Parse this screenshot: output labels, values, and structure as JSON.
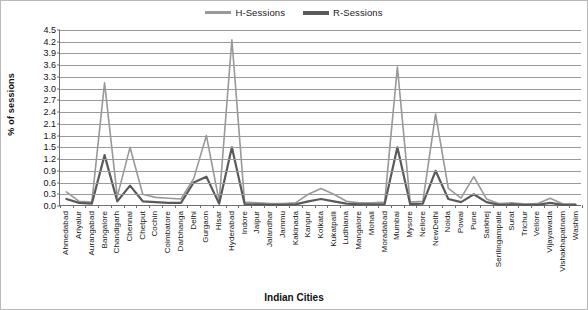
{
  "chart_data": {
    "type": "line",
    "title": "",
    "xlabel": "Indian Cities",
    "ylabel": "% of sessions",
    "ylim": [
      0.0,
      4.5
    ],
    "yticks": [
      "0.0",
      "0.3",
      "0.6",
      "0.9",
      "1.2",
      "1.5",
      "1.8",
      "2.1",
      "2.4",
      "2.7",
      "3.0",
      "3.3",
      "3.6",
      "3.9",
      "4.2",
      "4.5"
    ],
    "grid": true,
    "legend_position": "top-center",
    "categories": [
      "Ahmedabad",
      "Ariyalur",
      "Aurangabad",
      "Bangalore",
      "Chandigarh",
      "Chennai",
      "Chetput",
      "Cochin",
      "Coimbatore",
      "Darbhanga",
      "Delhi",
      "Gurgaon",
      "Hisar",
      "Hyderabad",
      "Indore",
      "Jaipur",
      "Jalandhar",
      "Jammu",
      "Kakinada",
      "Kanpur",
      "Kolkata",
      "Kukatpalli",
      "Ludhiana",
      "Mangalore",
      "Mohali",
      "Moradabad",
      "Mumbai",
      "Mysore",
      "Nellore",
      "NewDelhi",
      "Noida",
      "Powai",
      "Pune",
      "Sarkhej",
      "Serilingampalle",
      "Surat",
      "Trichur",
      "Vellore",
      "Vijayawada",
      "Vishakhapatnam",
      "Washim"
    ],
    "series": [
      {
        "name": "H-Sessions",
        "color": "#999999",
        "values": [
          0.36,
          0.12,
          0.1,
          3.15,
          0.24,
          1.5,
          0.3,
          0.22,
          0.2,
          0.18,
          0.7,
          1.8,
          0.12,
          4.25,
          0.1,
          0.08,
          0.06,
          0.06,
          0.08,
          0.3,
          0.45,
          0.3,
          0.12,
          0.08,
          0.08,
          0.1,
          3.55,
          0.1,
          0.12,
          2.35,
          0.45,
          0.2,
          0.75,
          0.18,
          0.06,
          0.08,
          0.05,
          0.06,
          0.2,
          0.05,
          0.05
        ]
      },
      {
        "name": "R-Sessions",
        "color": "#5a5a5a",
        "values": [
          0.18,
          0.08,
          0.06,
          1.3,
          0.12,
          0.52,
          0.12,
          0.1,
          0.08,
          0.08,
          0.6,
          0.75,
          0.06,
          1.5,
          0.05,
          0.04,
          0.03,
          0.03,
          0.04,
          0.12,
          0.18,
          0.12,
          0.06,
          0.04,
          0.04,
          0.05,
          1.5,
          0.05,
          0.06,
          0.9,
          0.18,
          0.1,
          0.3,
          0.1,
          0.03,
          0.04,
          0.03,
          0.03,
          0.08,
          0.03,
          0.03
        ]
      }
    ]
  },
  "legend": {
    "items": [
      {
        "label": "H-Sessions",
        "color": "#999999"
      },
      {
        "label": "R-Sessions",
        "color": "#5a5a5a"
      }
    ]
  }
}
